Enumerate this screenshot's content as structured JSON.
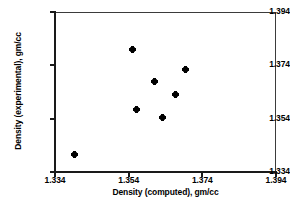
{
  "chart_data": {
    "type": "scatter",
    "title": "",
    "xlabel": "Density (computed), gm/cc",
    "ylabel": "Density (experimental), gm/cc",
    "xlim": [
      1.334,
      1.394
    ],
    "ylim": [
      1.334,
      1.394
    ],
    "xticks": [
      "1.334",
      "1.354",
      "1.374",
      "1.394"
    ],
    "yticks": [
      "1.334",
      "1.354",
      "1.374",
      "1.394"
    ],
    "xtick_values": [
      1.334,
      1.354,
      1.374,
      1.394
    ],
    "ytick_values": [
      1.334,
      1.354,
      1.374,
      1.394
    ],
    "grid": false,
    "legend": null,
    "marker_color": "#000000",
    "frame_color": "#3b3b3b",
    "points": [
      {
        "x": 1.3394,
        "y": 1.3404
      },
      {
        "x": 1.355,
        "y": 1.3801
      },
      {
        "x": 1.3562,
        "y": 1.3573
      },
      {
        "x": 1.3611,
        "y": 1.3678
      },
      {
        "x": 1.3633,
        "y": 1.3546
      },
      {
        "x": 1.3666,
        "y": 1.3629
      },
      {
        "x": 1.3695,
        "y": 1.3723
      }
    ]
  }
}
